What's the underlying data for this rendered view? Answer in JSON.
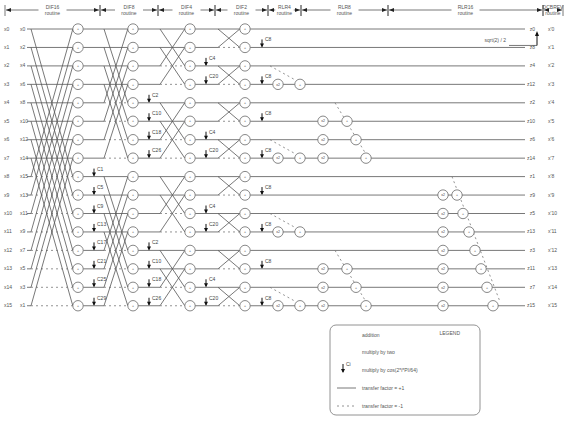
{
  "routines": [
    {
      "name": "DIF16",
      "sub": "routine",
      "x1": 5,
      "x2": 100
    },
    {
      "name": "DIF8",
      "sub": "routine",
      "x1": 100,
      "x2": 158
    },
    {
      "name": "DIF4",
      "sub": "routine",
      "x1": 158,
      "x2": 215
    },
    {
      "name": "DIF2",
      "sub": "routine",
      "x1": 215,
      "x2": 268
    },
    {
      "name": "RLR4",
      "sub": "routine",
      "x1": 268,
      "x2": 301
    },
    {
      "name": "RLR8",
      "sub": "routine",
      "x1": 301,
      "x2": 388
    },
    {
      "name": "RLR16",
      "sub": "routine",
      "x1": 388,
      "x2": 543
    },
    {
      "name": "DCBREV",
      "sub": "routine",
      "x1": 543,
      "x2": 563
    }
  ],
  "inputs_left": [
    "x0",
    "x1",
    "x2",
    "x3",
    "x4",
    "x5",
    "x6",
    "x7",
    "x8",
    "x9",
    "x10",
    "x11",
    "x12",
    "x13",
    "x14",
    "x15"
  ],
  "inputs_permuted": [
    "x0",
    "x2",
    "x4",
    "x6",
    "x8",
    "x10",
    "x12",
    "x14",
    "x15",
    "x13",
    "x11",
    "x9",
    "x7",
    "x5",
    "x3",
    "x1"
  ],
  "outputs_z": [
    "z0",
    "z8",
    "z4",
    "z12",
    "z2",
    "z10",
    "z6",
    "z14",
    "z1",
    "z9",
    "z5",
    "z13",
    "z3",
    "z11",
    "z7",
    "z15"
  ],
  "outputs_x": [
    "x'0",
    "x'1",
    "x'2",
    "x'3",
    "x'4",
    "x'5",
    "x'6",
    "x'7",
    "x'8",
    "x'9",
    "x'10",
    "x'11",
    "x'12",
    "x'13",
    "x'14",
    "x'15"
  ],
  "dif16_coeffs": [
    "C1",
    "C5",
    "C9",
    "C13",
    "C17",
    "C21",
    "C25",
    "C29"
  ],
  "dif8_coeffs": [
    "C2",
    "C10",
    "C18",
    "C26",
    "C2",
    "C10",
    "C18",
    "C26"
  ],
  "dif4_coeffs": [
    "C4",
    "C20",
    "C4",
    "C20",
    "C4",
    "C20",
    "C4",
    "C20"
  ],
  "dif2_coeff": "C8",
  "dcbrev_note": "sqrt(2) / 2",
  "legend": {
    "title": "LEGEND",
    "items": [
      {
        "symbol": "addition-node",
        "label": "addition"
      },
      {
        "symbol": "multiply-two-node",
        "label": "multiply by two"
      },
      {
        "symbol": "cos-multiplier-arrow",
        "label": "multiply by cos(2*i*PI/64)",
        "sub": "Ci"
      },
      {
        "symbol": "solid-line",
        "label": "transfer factor = +1"
      },
      {
        "symbol": "dashed-line",
        "label": "transfer factor = -1"
      }
    ]
  },
  "node_symbols": {
    "add": "+",
    "mul2": "x2"
  }
}
